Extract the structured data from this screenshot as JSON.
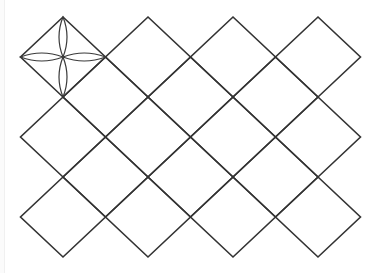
{
  "diagram": {
    "type": "diamond-lattice-with-flower",
    "colors": {
      "line": "#333333",
      "petal": "#3a3a3a",
      "background": "#ffffff"
    },
    "lattice": {
      "half_width": 42.5,
      "half_height": 40,
      "primary_centers": [
        [
          63,
          57
        ],
        [
          148,
          57
        ],
        [
          233,
          57
        ],
        [
          318,
          57
        ],
        [
          63,
          137
        ],
        [
          148,
          137
        ],
        [
          233,
          137
        ],
        [
          318,
          137
        ],
        [
          63,
          217
        ],
        [
          148,
          217
        ],
        [
          233,
          217
        ],
        [
          318,
          217
        ]
      ],
      "secondary_centers": [
        [
          105.5,
          97
        ],
        [
          190.5,
          97
        ],
        [
          275.5,
          97
        ],
        [
          105.5,
          177
        ],
        [
          190.5,
          177
        ],
        [
          275.5,
          177
        ]
      ]
    },
    "flower": {
      "center": [
        63,
        57
      ],
      "petal_count": 4,
      "petal_tips": [
        [
          63,
          17
        ],
        [
          105.5,
          57
        ],
        [
          63,
          97
        ],
        [
          20.5,
          57
        ]
      ],
      "petal_half_width": 4
    }
  }
}
